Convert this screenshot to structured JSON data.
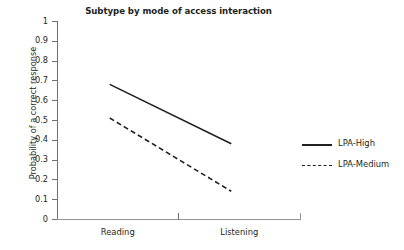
{
  "chart_data": {
    "type": "line",
    "title": "Subtype by mode of access interaction",
    "xlabel": "",
    "ylabel": "Probability of a correct response",
    "categories": [
      "Reading",
      "Listening"
    ],
    "ylim": [
      0,
      1
    ],
    "yticks": [
      "0",
      "0.1",
      "0.2",
      "0.3",
      "0.4",
      "0.5",
      "0.6",
      "0.7",
      "0.8",
      "0.9",
      "1"
    ],
    "ytick_values": [
      0,
      0.1,
      0.2,
      0.3,
      0.4,
      0.5,
      0.6,
      0.7,
      0.8,
      0.9,
      1
    ],
    "grid": false,
    "legend_position": "right",
    "series": [
      {
        "name": "LPA-High",
        "values": [
          0.68,
          0.38
        ],
        "style": "solid",
        "color": "#231f20"
      },
      {
        "name": "LPA-Medium",
        "values": [
          0.51,
          0.14
        ],
        "style": "dashed",
        "color": "#231f20"
      }
    ]
  },
  "legend": {
    "items": [
      {
        "label": "LPA-High",
        "style": "solid"
      },
      {
        "label": "LPA-Medium",
        "style": "dashed"
      }
    ]
  },
  "colors": {
    "line": "#231f20",
    "axis": "#6d6e71",
    "axis_light": "#939598",
    "text": "#231f20",
    "background": "#ffffff"
  }
}
